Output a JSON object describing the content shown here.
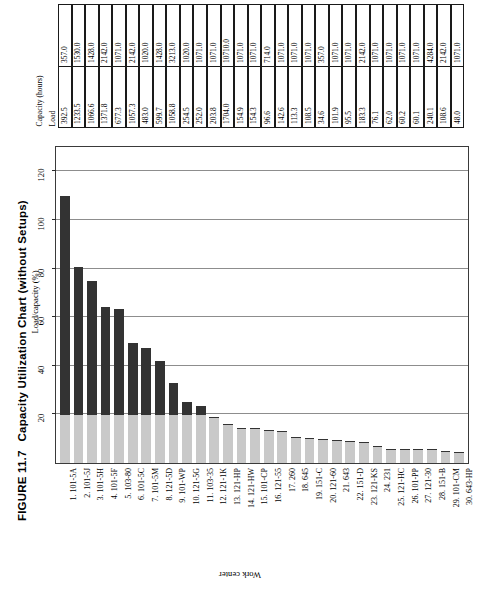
{
  "figure": {
    "number": "FIGURE 11.7",
    "title": "Capacity Utilization Chart (without Setups)"
  },
  "table": {
    "header_capacity": "Capacity (hours)",
    "header_load": "Load",
    "rows": [
      {
        "n": 1,
        "work_center": "101-5A",
        "load": "392.5",
        "capacity": "357.0"
      },
      {
        "n": 2,
        "work_center": "101-5J",
        "load": "1233.5",
        "capacity": "1530.0"
      },
      {
        "n": 3,
        "work_center": "101-5H",
        "load": "1066.6",
        "capacity": "1428.0"
      },
      {
        "n": 4,
        "work_center": "101-5F",
        "load": "1371.8",
        "capacity": "2142.0"
      },
      {
        "n": 5,
        "work_center": "103-80",
        "load": "677.3",
        "capacity": "1071.0"
      },
      {
        "n": 6,
        "work_center": "101-5C",
        "load": "1057.3",
        "capacity": "2142.0"
      },
      {
        "n": 7,
        "work_center": "101-5M",
        "load": "483.0",
        "capacity": "1020.0"
      },
      {
        "n": 8,
        "work_center": "121-5D",
        "load": "599.7",
        "capacity": "1428.0"
      },
      {
        "n": 9,
        "work_center": "101-WP",
        "load": "1058.8",
        "capacity": "3213.0"
      },
      {
        "n": 10,
        "work_center": "121-5G",
        "load": "254.5",
        "capacity": "1020.0"
      },
      {
        "n": 11,
        "work_center": "103-35",
        "load": "252.0",
        "capacity": "1071.0"
      },
      {
        "n": 12,
        "work_center": "121-1K",
        "load": "203.8",
        "capacity": "1071.0"
      },
      {
        "n": 13,
        "work_center": "121-HP",
        "load": "1704.0",
        "capacity": "10710.0"
      },
      {
        "n": 14,
        "work_center": "121-HW",
        "load": "154.9",
        "capacity": "1071.0"
      },
      {
        "n": 15,
        "work_center": "101-CP",
        "load": "154.3",
        "capacity": "1071.0"
      },
      {
        "n": 16,
        "work_center": "121-55",
        "load": "96.6",
        "capacity": "714.0"
      },
      {
        "n": 17,
        "work_center": "260",
        "load": "142.6",
        "capacity": "1071.0"
      },
      {
        "n": 18,
        "work_center": "645",
        "load": "113.3",
        "capacity": "1071.0"
      },
      {
        "n": 19,
        "work_center": "151-C",
        "load": "108.5",
        "capacity": "1071.0"
      },
      {
        "n": 20,
        "work_center": "121-60",
        "load": "34.6",
        "capacity": "357.0"
      },
      {
        "n": 21,
        "work_center": "643",
        "load": "101.9",
        "capacity": "1071.0"
      },
      {
        "n": 22,
        "work_center": "151-D",
        "load": "95.5",
        "capacity": "1071.0"
      },
      {
        "n": 23,
        "work_center": "121-KS",
        "load": "183.3",
        "capacity": "2142.0"
      },
      {
        "n": 24,
        "work_center": "231",
        "load": "76.1",
        "capacity": "1071.0"
      },
      {
        "n": 25,
        "work_center": "121-HC",
        "load": "62.0",
        "capacity": "1071.0"
      },
      {
        "n": 26,
        "work_center": "101-PP",
        "load": "60.2",
        "capacity": "1071.0"
      },
      {
        "n": 27,
        "work_center": "121-30",
        "load": "60.1",
        "capacity": "1071.0"
      },
      {
        "n": 28,
        "work_center": "151-B",
        "load": "240.1",
        "capacity": "4284.0"
      },
      {
        "n": 29,
        "work_center": "101-CM",
        "load": "108.6",
        "capacity": "2142.0"
      },
      {
        "n": 30,
        "work_center": "643-HP",
        "load": "48.0",
        "capacity": "1071.0"
      }
    ]
  },
  "chart_data": {
    "type": "bar",
    "title": "Capacity Utilization Chart (without Setups)",
    "xlabel": "Work center",
    "ylabel": "Load/capacity (%)",
    "ylim": [
      0,
      130
    ],
    "yticks": [
      "20",
      "40",
      "60",
      "80",
      "100",
      "120"
    ],
    "grid": true,
    "legend": "none",
    "stacked": true,
    "colors": {
      "upper_segment": "#333333",
      "base_segment": "#c9c9c9"
    },
    "base_segment_value": 20,
    "categories": [
      "1. 101-5A",
      "2. 101-5J",
      "3. 101-5H",
      "4. 101-5F",
      "5. 103-80",
      "6. 101-5C",
      "7. 101-5M",
      "8. 121-5D",
      "9. 101-WP",
      "10. 121-5G",
      "11. 103-35",
      "12. 121-1K",
      "13. 121-HP",
      "14. 121-HW",
      "15. 101-CP",
      "16. 121-55",
      "17. 260",
      "18. 645",
      "19. 151-C",
      "20. 121-60",
      "21. 643",
      "22. 151-D",
      "23. 121-KS",
      "24. 231",
      "25. 121-HC",
      "26. 101-PP",
      "27. 121-30",
      "28. 151-B",
      "29. 101-CM",
      "30. 643-HP"
    ],
    "values": [
      110.0,
      80.6,
      74.7,
      64.0,
      63.2,
      49.4,
      47.4,
      42.0,
      33.0,
      25.0,
      23.5,
      19.0,
      15.9,
      14.5,
      14.4,
      13.5,
      13.3,
      10.6,
      10.1,
      9.7,
      9.5,
      8.9,
      8.6,
      7.1,
      5.8,
      5.6,
      5.6,
      5.6,
      5.1,
      4.5
    ],
    "values_label": "Load/capacity (%)"
  }
}
